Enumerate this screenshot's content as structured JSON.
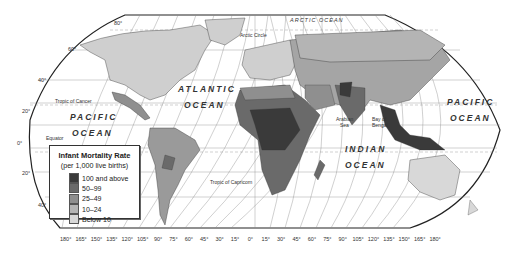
{
  "map": {
    "title": "Infant Mortality Rate world map",
    "oceans": {
      "atlantic_1": "ATLANTIC",
      "atlantic_2": "OCEAN",
      "pacific_w_1": "PACIFIC",
      "pacific_w_2": "OCEAN",
      "pacific_e_1": "PACIFIC",
      "pacific_e_2": "OCEAN",
      "indian_1": "INDIAN",
      "indian_2": "OCEAN",
      "arctic": "ARCTIC OCEAN"
    },
    "features": {
      "arctic_circle": "Arctic Circle",
      "tropic_cancer": "Tropic of Cancer",
      "tropic_capricorn": "Tropic of Capricorn",
      "equator": "Equator",
      "arabian_sea_1": "Arabian",
      "arabian_sea_2": "Sea",
      "bay_bengal_1": "Bay of",
      "bay_bengal_2": "Bengal"
    },
    "latitude_labels": {
      "lat80": "80°",
      "lat60": "60°",
      "lat40n": "40°",
      "lat20n": "20°",
      "lat0": "0°",
      "lat20s": "20°",
      "lat40s": "40°"
    },
    "longitude_ticks": [
      "180°",
      "165°",
      "150°",
      "135°",
      "120°",
      "105°",
      "90°",
      "75°",
      "60°",
      "45°",
      "30°",
      "15°",
      "0°",
      "15°",
      "30°",
      "45°",
      "60°",
      "75°",
      "90°",
      "105°",
      "120°",
      "135°",
      "150°",
      "165°",
      "180°"
    ]
  },
  "legend": {
    "title": "Infant Mortality Rate",
    "subtitle": "(per 1,000 live births)",
    "items": [
      {
        "label": "100 and above",
        "color": "#3a3a3a"
      },
      {
        "label": "50–99",
        "color": "#6a6a6a"
      },
      {
        "label": "25–49",
        "color": "#8f8f8f"
      },
      {
        "label": "10–24",
        "color": "#b4b4b4"
      },
      {
        "label": "Below 10",
        "color": "#d8d8d8"
      }
    ]
  }
}
